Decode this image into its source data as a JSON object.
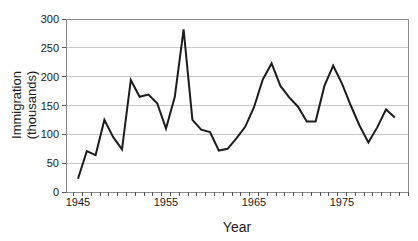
{
  "chart_data": {
    "type": "line",
    "title": "",
    "xlabel": "Year",
    "ylabel": "Immigration (thousands)",
    "ylabel_lines": [
      "Immigration",
      "(thousands)"
    ],
    "series_name": "Immigration",
    "x": [
      1945,
      1946,
      1947,
      1948,
      1949,
      1950,
      1951,
      1952,
      1953,
      1954,
      1955,
      1956,
      1957,
      1958,
      1959,
      1960,
      1961,
      1962,
      1963,
      1964,
      1965,
      1966,
      1967,
      1968,
      1969,
      1970,
      1971,
      1972,
      1973,
      1974,
      1975,
      1976,
      1977,
      1978,
      1979,
      1980,
      1981
    ],
    "values": [
      23,
      71,
      64,
      125,
      95,
      74,
      194,
      165,
      169,
      154,
      110,
      165,
      282,
      125,
      108,
      104,
      72,
      75,
      93,
      113,
      147,
      195,
      223,
      184,
      164,
      148,
      122,
      122,
      184,
      219,
      188,
      150,
      115,
      86,
      112,
      143,
      129
    ],
    "ylim": [
      0,
      300
    ],
    "yticks": [
      0,
      50,
      100,
      150,
      200,
      250,
      300
    ],
    "xticks": [
      1945,
      1955,
      1965,
      1975
    ],
    "grid": "horizontal",
    "legend": "none",
    "colors": {
      "line": "#1c1c1c",
      "grid": "#c9c9c9",
      "frame": "#8c8c8c",
      "tick": "#555555",
      "text": "#1a1a1a",
      "background": "#ffffff"
    }
  }
}
